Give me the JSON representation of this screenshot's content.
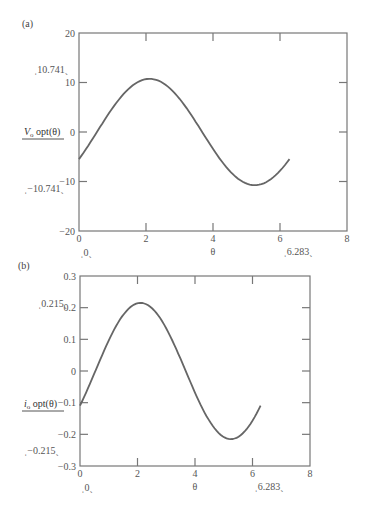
{
  "panels": [
    {
      "label": "(a)",
      "ylabel_main": "V",
      "ylabel_sub": "o",
      "ylabel_rest": " opt(θ)",
      "xlabel": "θ",
      "yticks": [
        "20",
        "10",
        "0",
        "−10",
        "−20"
      ],
      "xticks": [
        "0",
        "2",
        "4",
        "6",
        "8"
      ],
      "annotations": {
        "ymax": "10.741",
        "ymin": "−10.741",
        "xmin": "0",
        "xmax": "6.283"
      }
    },
    {
      "label": "(b)",
      "ylabel_main": "i",
      "ylabel_sub": "o",
      "ylabel_rest": " opt(θ)",
      "xlabel": "θ",
      "yticks": [
        "0.3",
        "0.2",
        "0.1",
        "0",
        "−0.1",
        "−0.2",
        "−0.3"
      ],
      "xticks": [
        "0",
        "2",
        "4",
        "6",
        "8"
      ],
      "annotations": {
        "ymax": "0.215",
        "ymin": "−0.215",
        "xmin": "0",
        "xmax": "6.283"
      }
    }
  ],
  "chart_data": [
    {
      "type": "line",
      "title": "(a)",
      "xlabel": "θ",
      "ylabel": "V_o opt(θ)",
      "xlim": [
        0,
        8
      ],
      "ylim": [
        -20,
        20
      ],
      "xticks": [
        0,
        2,
        4,
        6,
        8
      ],
      "yticks": [
        -20,
        -10,
        0,
        10,
        20
      ],
      "grid": false,
      "series": [
        {
          "name": "V_o opt(θ)",
          "amplitude": 10.741,
          "phase_shift": 0.535,
          "x": [
            0,
            0.5,
            1.0,
            1.5,
            2.0,
            2.1,
            2.5,
            3.0,
            3.5,
            4.0,
            4.5,
            5.0,
            5.25,
            5.5,
            6.0,
            6.283
          ],
          "y": [
            -5.5,
            -0.4,
            4.8,
            8.9,
            10.7,
            10.74,
            10.0,
            7.1,
            2.8,
            -2.1,
            -6.6,
            -9.8,
            -10.7,
            -10.5,
            -8.1,
            -5.5
          ]
        }
      ],
      "annotations": [
        "10.741",
        "−10.741",
        "0",
        "6.283"
      ]
    },
    {
      "type": "line",
      "title": "(b)",
      "xlabel": "θ",
      "ylabel": "i_o opt(θ)",
      "xlim": [
        0,
        8
      ],
      "ylim": [
        -0.3,
        0.3
      ],
      "xticks": [
        0,
        2,
        4,
        6,
        8
      ],
      "yticks": [
        -0.3,
        -0.2,
        -0.1,
        0,
        0.1,
        0.2,
        0.3
      ],
      "grid": false,
      "series": [
        {
          "name": "i_o opt(θ)",
          "amplitude": 0.215,
          "phase_shift": 0.535,
          "x": [
            0,
            0.5,
            1.0,
            1.5,
            2.0,
            2.1,
            2.5,
            3.0,
            3.5,
            4.0,
            4.5,
            5.0,
            5.25,
            5.5,
            6.0,
            6.283
          ],
          "y": [
            -0.11,
            -0.008,
            0.096,
            0.178,
            0.214,
            0.215,
            0.2,
            0.142,
            0.056,
            -0.042,
            -0.132,
            -0.196,
            -0.214,
            -0.21,
            -0.162,
            -0.11
          ]
        }
      ],
      "annotations": [
        "0.215",
        "−0.215",
        "0",
        "6.283"
      ]
    }
  ]
}
